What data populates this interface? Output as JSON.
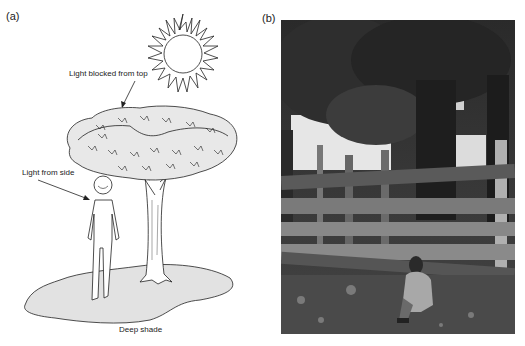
{
  "panel_a": {
    "label": "(a)",
    "annotations": {
      "top": "Light blocked from top",
      "side": "Light from side",
      "bottom": "Deep shade"
    }
  },
  "panel_b": {
    "label": "(b)"
  }
}
